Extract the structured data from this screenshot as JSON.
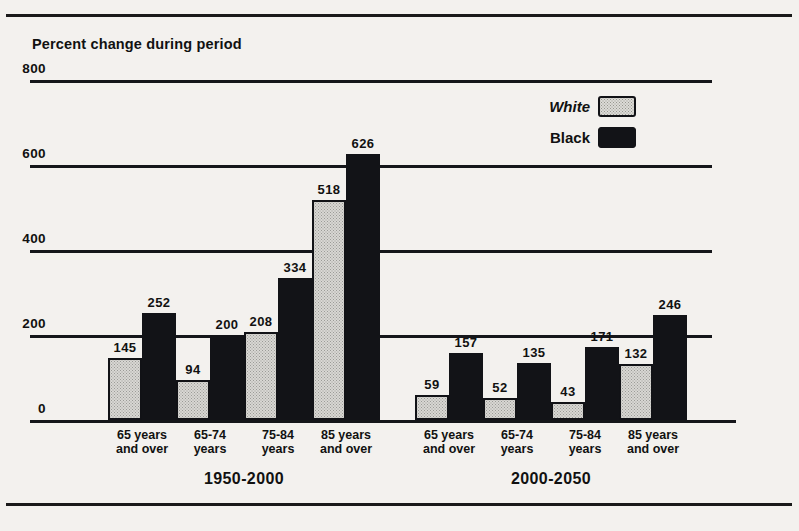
{
  "axis_title": "Percent change during period",
  "legend": [
    {
      "label": "White",
      "style": "italic",
      "swatch": "white"
    },
    {
      "label": "Black",
      "style": "normal",
      "swatch": "black"
    }
  ],
  "periods": [
    {
      "label": "1950-2000"
    },
    {
      "label": "2000-2050"
    }
  ],
  "category_labels": [
    {
      "line1": "65 years",
      "line2": "and over"
    },
    {
      "line1": "65-74",
      "line2": "years"
    },
    {
      "line1": "75-84",
      "line2": "years"
    },
    {
      "line1": "85 years",
      "line2": "and over"
    }
  ],
  "colors": {
    "white_bar": "#d8d7d3",
    "black_bar": "#121317",
    "ink": "#15161a",
    "paper": "#f3f1ee"
  },
  "chart_data": {
    "type": "bar",
    "title": "",
    "subtitle": "",
    "xlabel": "",
    "ylabel": "Percent change during period",
    "ylim": [
      0,
      800
    ],
    "yticks": [
      0,
      200,
      400,
      600,
      800
    ],
    "ytick_labels": [
      "0",
      "200",
      "400",
      "600",
      "800"
    ],
    "grid": true,
    "legend_position": "upper-right",
    "groups": [
      {
        "name": "1950-2000",
        "categories": [
          "65 years and over",
          "65-74 years",
          "75-84 years",
          "85 years and over"
        ],
        "series": [
          {
            "name": "White",
            "values": [
              145,
              94,
              208,
              518
            ]
          },
          {
            "name": "Black",
            "values": [
              252,
              200,
              334,
              626
            ]
          }
        ]
      },
      {
        "name": "2000-2050",
        "categories": [
          "65 years and over",
          "65-74 years",
          "75-84 years",
          "85 years and over"
        ],
        "series": [
          {
            "name": "White",
            "values": [
              59,
              52,
              43,
              132
            ]
          },
          {
            "name": "Black",
            "values": [
              157,
              135,
              171,
              246
            ]
          }
        ]
      }
    ]
  }
}
